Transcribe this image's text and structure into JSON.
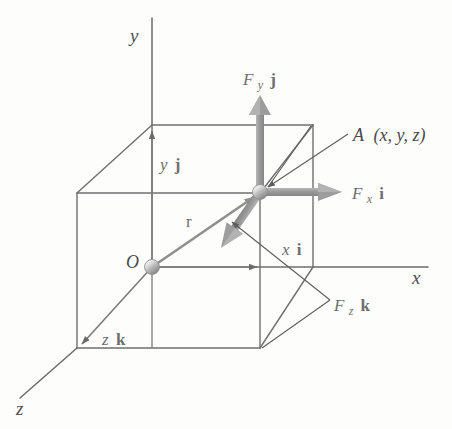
{
  "figure": {
    "type": "vector-diagram",
    "colors": {
      "axis_line": "#6b6b6b",
      "cube_edge": "#6f6f6f",
      "vector_arrow": "#9a9a9a",
      "leader_line": "#5d5d5d",
      "node_fill": "#b0b0b0",
      "label_text": "#555555",
      "background": "#fdfdfc"
    },
    "axes": [
      {
        "name": "y-axis",
        "label": "y"
      },
      {
        "name": "x-axis",
        "label": "x"
      },
      {
        "name": "z-axis",
        "label": "z"
      }
    ],
    "points": [
      {
        "name": "origin",
        "label": "O"
      },
      {
        "name": "point-a",
        "label": "A (x, y, z)"
      }
    ],
    "vectors": [
      {
        "name": "position-vector",
        "label": "r"
      },
      {
        "name": "force-y-component",
        "label_main": "F",
        "label_sub": "y",
        "label_unit": "j"
      },
      {
        "name": "force-x-component",
        "label_main": "F",
        "label_sub": "x",
        "label_unit": "i"
      },
      {
        "name": "force-z-component",
        "label_main": "F",
        "label_sub": "z",
        "label_unit": "k"
      }
    ],
    "component_labels": [
      {
        "name": "y-component",
        "value": "y",
        "unit": "j"
      },
      {
        "name": "x-component",
        "value": "x",
        "unit": "i"
      },
      {
        "name": "z-component",
        "value": "z",
        "unit": "k"
      }
    ],
    "text": {
      "axis_y": "y",
      "axis_x": "x",
      "axis_z": "z",
      "origin": "O",
      "point_a": "A (x, y, z)",
      "point_a_name": "A",
      "point_a_coords": "(x, y, z)",
      "r": "r",
      "F": "F",
      "sub_x": "x",
      "sub_y": "y",
      "sub_z": "z",
      "unit_i": "i",
      "unit_j": "j",
      "unit_k": "k",
      "comp_x": "x",
      "comp_y": "y",
      "comp_z": "z"
    }
  }
}
